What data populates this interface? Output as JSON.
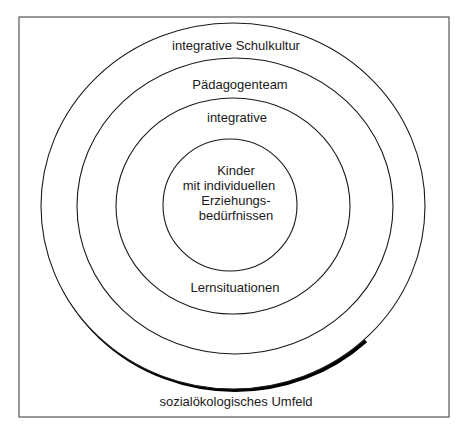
{
  "diagram": {
    "type": "concentric-circles",
    "frame": {
      "x": 19,
      "y": 17,
      "width": 430,
      "height": 400
    },
    "center": {
      "x": 233,
      "y": 206
    },
    "rings": [
      {
        "name": "outer",
        "rx": 192,
        "ry": 183,
        "label": "integrative Schulkultur",
        "shadow": true
      },
      {
        "name": "second",
        "rx": 158,
        "ry": 148,
        "label": "Pädagogenteam"
      },
      {
        "name": "third",
        "rx": 117,
        "ry": 108,
        "label_top": "integrative",
        "label_bottom": "Lernsituationen"
      },
      {
        "name": "inner",
        "rx": 67,
        "ry": 66,
        "label_lines": [
          "Kinder",
          "mit individuellen",
          "Erziehungs-",
          "bedürfnissen"
        ]
      }
    ],
    "outside_label": "sozialökologisches Umfeld",
    "colors": {
      "line": "#1a1a1a",
      "frame": "#555555",
      "background": "#ffffff"
    }
  }
}
